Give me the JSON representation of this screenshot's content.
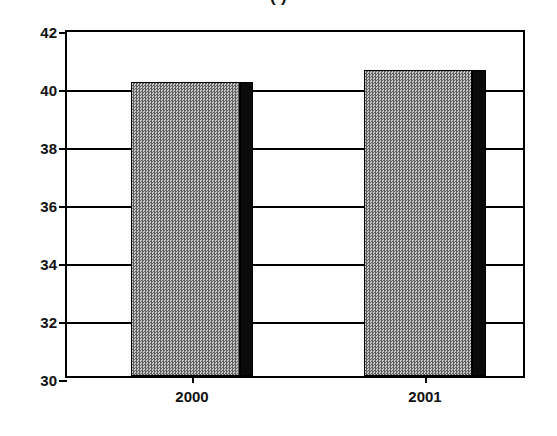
{
  "chart_data": {
    "type": "bar",
    "title": "(      )",
    "categories": [
      "2000",
      "2001"
    ],
    "values": [
      40.15,
      40.55
    ],
    "series": [
      {
        "name": "",
        "values": [
          40.15,
          40.55
        ]
      }
    ],
    "xlabel": "",
    "ylabel": "",
    "ylim": [
      30,
      42
    ],
    "yticks": [
      30,
      32,
      34,
      36,
      38,
      40,
      42
    ],
    "ytick_labels": [
      "30",
      "32",
      "34",
      "36",
      "38",
      "40",
      "42"
    ],
    "grid": true,
    "legend": false,
    "legend_position": "none",
    "bar_style": "3d-shadow",
    "colors": {
      "bar_fill": "#8a8a8a",
      "bar_shadow": "#0a0a0a",
      "axis": "#000000",
      "background": "#ffffff",
      "text": "#111111"
    }
  },
  "axis": {
    "y_labels": [
      "42",
      "40",
      "38",
      "36",
      "34",
      "32",
      "30"
    ]
  },
  "bars": [
    {
      "label": "2000",
      "value": 40.15
    },
    {
      "label": "2001",
      "value": 40.55
    }
  ]
}
